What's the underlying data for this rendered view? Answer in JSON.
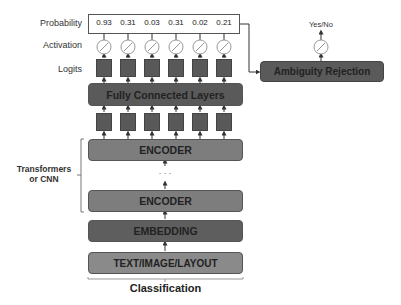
{
  "diagram": {
    "title": "Classification",
    "row_labels": {
      "probability": "Probability",
      "activation": "Activation",
      "logits": "Logits"
    },
    "probabilities": [
      "0.93",
      "0.31",
      "0.03",
      "0.31",
      "0.02",
      "0.21"
    ],
    "blocks": {
      "fully_connected": "Fully Connected Layers",
      "encoder_top": "ENCODER",
      "ellipsis": ". . .",
      "encoder_bottom": "ENCODER",
      "embedding": "EMBEDDING",
      "input": "TEXT/IMAGE/LAYOUT"
    },
    "bracket_label_line1": "Transformers",
    "bracket_label_line2": "or CNN",
    "side_branch": {
      "box_label": "Ambiguity Rejection",
      "output_label": "Yes/No"
    },
    "colors": {
      "dark_block": "#5a5a5a",
      "mid_block": "#7a7a7a",
      "light_block": "#8c8c8c",
      "square": "#595959"
    }
  }
}
